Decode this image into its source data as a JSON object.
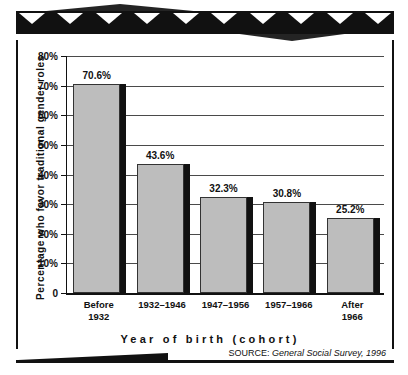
{
  "chart_data": {
    "type": "bar",
    "title": "",
    "subtitle": "",
    "xlabel": "Year of birth (cohort)",
    "ylabel": "Percentage who favor traditional gender roles",
    "categories": [
      "Before 1932",
      "1932–1946",
      "1947–1956",
      "1957–1966",
      "After 1966"
    ],
    "category_lines": [
      [
        "Before",
        "1932"
      ],
      [
        "1932–1946",
        ""
      ],
      [
        "1947–1956",
        ""
      ],
      [
        "1957–1966",
        ""
      ],
      [
        "After",
        "1966"
      ]
    ],
    "values": [
      70.6,
      43.6,
      32.3,
      30.8,
      25.2
    ],
    "value_labels": [
      "70.6%",
      "43.6%",
      "32.3%",
      "30.8%",
      "25.2%"
    ],
    "ylim": [
      0,
      80
    ],
    "yticks": [
      0,
      10,
      20,
      30,
      40,
      50,
      60,
      70,
      80
    ],
    "ytick_labels": [
      "0",
      "10%",
      "20%",
      "30%",
      "40%",
      "50%",
      "60%",
      "70%",
      "80%"
    ],
    "grid": true,
    "legend": "none",
    "bar_fill_color": "#bdbdbd",
    "bar_outline_color": "#333333",
    "bar_shadow_color": "#111111",
    "axis_color": "#111111",
    "grid_color": "#4a4a4a",
    "background_color": "#ffffff"
  },
  "source": {
    "label": "SOURCE:",
    "value": "General Social Survey, 1996"
  },
  "ornament": {
    "triangle_count": 10,
    "band_color": "#111111",
    "triangle_color": "#ffffff"
  }
}
